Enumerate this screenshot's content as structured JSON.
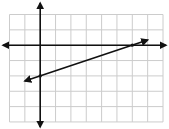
{
  "chart_data": {
    "type": "line",
    "title": "",
    "xlabel": "",
    "ylabel": "",
    "xlim": [
      -2,
      8
    ],
    "ylim": [
      -5,
      2
    ],
    "grid": true,
    "grid_step": 1,
    "tick_labels": false,
    "series": [
      {
        "name": "line",
        "equation": "y = (1/3)x - 2",
        "slope": 0.3333,
        "y_intercept": -2,
        "x_intercept": 6,
        "x": [
          -1,
          0,
          3,
          6,
          7
        ],
        "values": [
          -2.333,
          -2,
          -1,
          0,
          0.333
        ],
        "arrows": "both"
      }
    ]
  },
  "colors": {
    "grid": "#cccccc",
    "axis": "#111111",
    "line": "#111111",
    "background": "#ffffff"
  }
}
